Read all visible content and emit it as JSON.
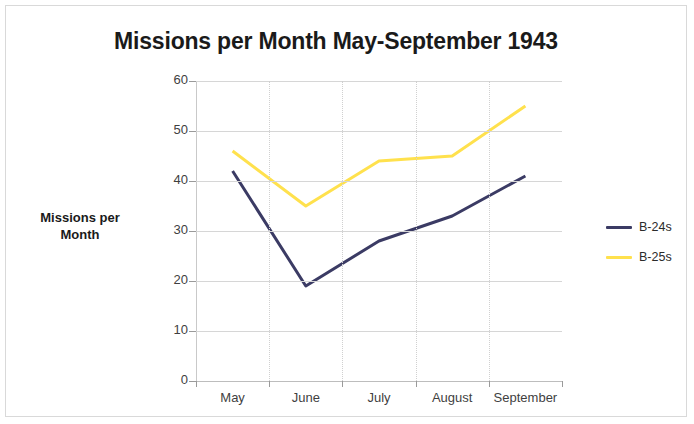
{
  "chart_data": {
    "type": "line",
    "title": "Missions per Month May-September 1943",
    "xlabel": "",
    "ylabel": "Missions per Month",
    "categories": [
      "May",
      "June",
      "July",
      "August",
      "September"
    ],
    "series": [
      {
        "name": "B-24s",
        "color": "#3b3b64",
        "values": [
          42,
          19,
          28,
          33,
          41
        ]
      },
      {
        "name": "B-25s",
        "color": "#ffe14d",
        "values": [
          46,
          35,
          44,
          45,
          55
        ]
      }
    ],
    "ylim": [
      0,
      60
    ],
    "yticks": [
      0,
      10,
      20,
      30,
      40,
      50,
      60
    ],
    "ytick_labels": [
      "0",
      "10",
      "20",
      "30",
      "40",
      "50",
      "60"
    ],
    "grid": "horizontal-and-vertical",
    "legend_position": "right"
  },
  "legend": {
    "items": [
      {
        "label": "B-24s",
        "color": "#3b3b64"
      },
      {
        "label": "B-25s",
        "color": "#ffe14d"
      }
    ]
  },
  "colors": {
    "b24_navy": "#3b3b64",
    "b25_yellow": "#ffe14d",
    "gridline": "#d6d6d6",
    "text": "#1a1a1a",
    "border": "#d9d9d9",
    "background": "#ffffff"
  }
}
